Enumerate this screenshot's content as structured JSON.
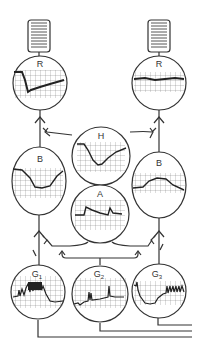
{
  "diagram": {
    "labels": {
      "R_left": "R",
      "R_right": "R",
      "H": "H",
      "B_left": "B",
      "B_right": "B",
      "A": "A",
      "G1": "G",
      "G1_sub": "1",
      "G2": "G",
      "G2_sub": "2",
      "G3": "G",
      "G3_sub": "3"
    },
    "nodes": [
      {
        "id": "coil-left",
        "type": "effector-coil"
      },
      {
        "id": "coil-right",
        "type": "effector-coil"
      },
      {
        "id": "R-left",
        "label": "R",
        "trace": "sharp drop then gradual rise"
      },
      {
        "id": "R-right",
        "label": "R",
        "trace": "flat with slight dip"
      },
      {
        "id": "H",
        "label": "H",
        "trace": "plateau, drop to trough, recovery"
      },
      {
        "id": "B-left",
        "label": "B",
        "trace": "trough"
      },
      {
        "id": "B-right",
        "label": "B",
        "trace": "hump"
      },
      {
        "id": "A",
        "label": "A",
        "trace": "step with spikes, decay"
      },
      {
        "id": "G1",
        "label": "G1",
        "trace": "dense burst"
      },
      {
        "id": "G2",
        "label": "G2",
        "trace": "baseline with spikes"
      },
      {
        "id": "G3",
        "label": "G3",
        "trace": "dip then repeated spikes"
      }
    ],
    "colors": {
      "stroke": "#333333",
      "grid": "#666666",
      "background": "#ffffff"
    }
  }
}
